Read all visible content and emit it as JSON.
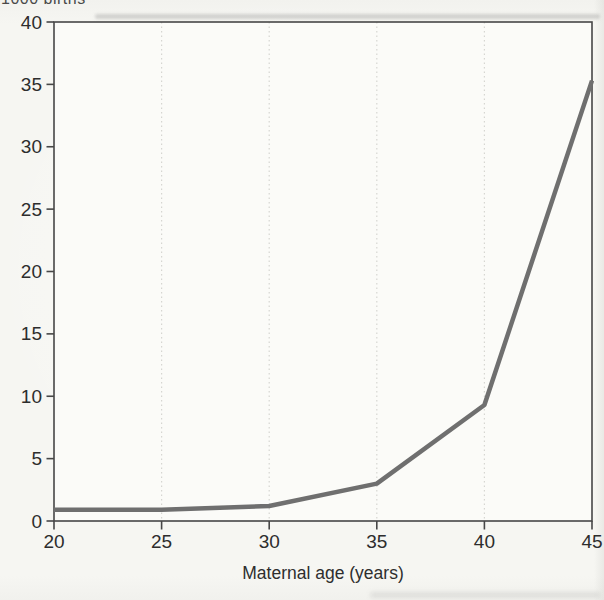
{
  "figure": {
    "y_axis_top_label": "1000 births",
    "x_axis_label": "Maternal age (years)"
  },
  "chart_data": {
    "type": "line",
    "title": "",
    "xlabel": "Maternal age (years)",
    "ylabel": "1000 births",
    "x": [
      20,
      25,
      30,
      35,
      40,
      45
    ],
    "values": [
      0.9,
      0.9,
      1.2,
      3,
      9.3,
      35.3
    ],
    "x_ticks": [
      20,
      25,
      30,
      35,
      40,
      45
    ],
    "y_ticks": [
      0,
      5,
      10,
      15,
      20,
      25,
      30,
      35,
      40
    ],
    "xlim": [
      20,
      45
    ],
    "ylim": [
      0,
      40
    ],
    "grid": "vertical-dotted-at-x-ticks",
    "legend": "none",
    "line_color": "#6f6f6f",
    "frame_color": "#474747",
    "grid_color": "#d6d6d1",
    "plot_background": "#fbfbf8"
  }
}
